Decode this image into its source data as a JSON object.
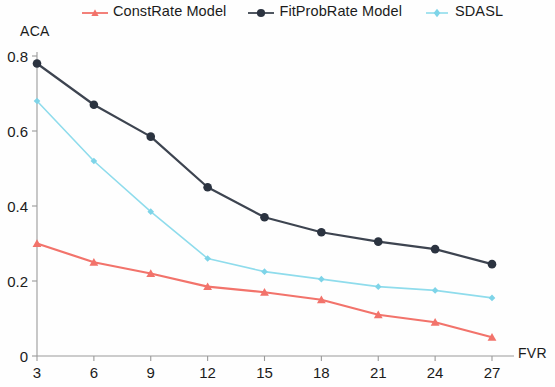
{
  "chart_data": {
    "type": "line",
    "title": "",
    "xlabel": "FVR",
    "ylabel": "ACA",
    "x": [
      3,
      6,
      9,
      12,
      15,
      18,
      21,
      24,
      27
    ],
    "xticklabels": [
      "3",
      "6",
      "9",
      "12",
      "15",
      "18",
      "21",
      "24",
      "27"
    ],
    "yticklabels": [
      "0",
      "0.2",
      "0.4",
      "0.6",
      "0.8"
    ],
    "yticks": [
      0,
      0.2,
      0.4,
      0.6,
      0.8
    ],
    "xlim": [
      3,
      27
    ],
    "ylim": [
      0,
      0.8
    ],
    "grid": false,
    "legend_position": "top",
    "series": [
      {
        "name": "ConstRate Model",
        "color": "#f2736b",
        "marker": "triangle",
        "values": [
          0.3,
          0.25,
          0.22,
          0.185,
          0.17,
          0.15,
          0.11,
          0.09,
          0.05
        ]
      },
      {
        "name": "FitProbRate Model",
        "color": "#3d4450",
        "marker": "circle",
        "values": [
          0.78,
          0.67,
          0.585,
          0.45,
          0.37,
          0.33,
          0.305,
          0.285,
          0.245
        ]
      },
      {
        "name": "SDASL",
        "color": "#8fdcec",
        "marker": "diamond",
        "values": [
          0.68,
          0.52,
          0.385,
          0.26,
          0.225,
          0.205,
          0.185,
          0.175,
          0.155
        ]
      }
    ]
  },
  "legend": {
    "items": [
      {
        "label": "ConstRate Model"
      },
      {
        "label": "FitProbRate Model"
      },
      {
        "label": "SDASL"
      }
    ]
  },
  "axes": {
    "y_title": "ACA",
    "x_title": "FVR"
  }
}
